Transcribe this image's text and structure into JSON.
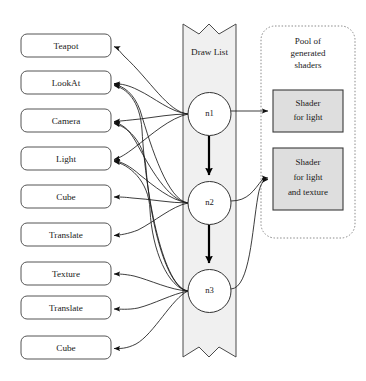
{
  "diagram": {
    "objects": {
      "heading": "Scene objects",
      "items": [
        {
          "id": "obj-teapot",
          "label": "Teapot"
        },
        {
          "id": "obj-lookat",
          "label": "LookAt"
        },
        {
          "id": "obj-camera",
          "label": "Camera"
        },
        {
          "id": "obj-light",
          "label": "Light"
        },
        {
          "id": "obj-cube-1",
          "label": "Cube"
        },
        {
          "id": "obj-translate-1",
          "label": "Translate"
        },
        {
          "id": "obj-texture",
          "label": "Texture"
        },
        {
          "id": "obj-translate-2",
          "label": "Translate"
        },
        {
          "id": "obj-cube-2",
          "label": "Cube"
        }
      ]
    },
    "draw_list": {
      "title": "Draw List",
      "nodes": [
        {
          "id": "node-n1",
          "label": "n1"
        },
        {
          "id": "node-n2",
          "label": "n2"
        },
        {
          "id": "node-n3",
          "label": "n3"
        }
      ]
    },
    "shader_pool": {
      "title_line_1": "Pool of",
      "title_line_2": "generated",
      "title_line_3": "shaders",
      "shaders": [
        {
          "id": "shader-light",
          "lines": [
            "Shader",
            "for light"
          ]
        },
        {
          "id": "shader-light-texture",
          "lines": [
            "Shader",
            "for light",
            "and texture"
          ]
        }
      ]
    },
    "colors": {
      "background": "#ffffff",
      "banner_fill": "#f0f0f0",
      "banner_stroke": "#4a4a4a",
      "box_stroke": "#555555",
      "shader_fill": "#dedede",
      "shader_stroke": "#3a3a3a",
      "pool_stroke": "#8a8a8a",
      "edge_stroke": "#1a1a1a",
      "text": "#1a1a1a"
    }
  }
}
